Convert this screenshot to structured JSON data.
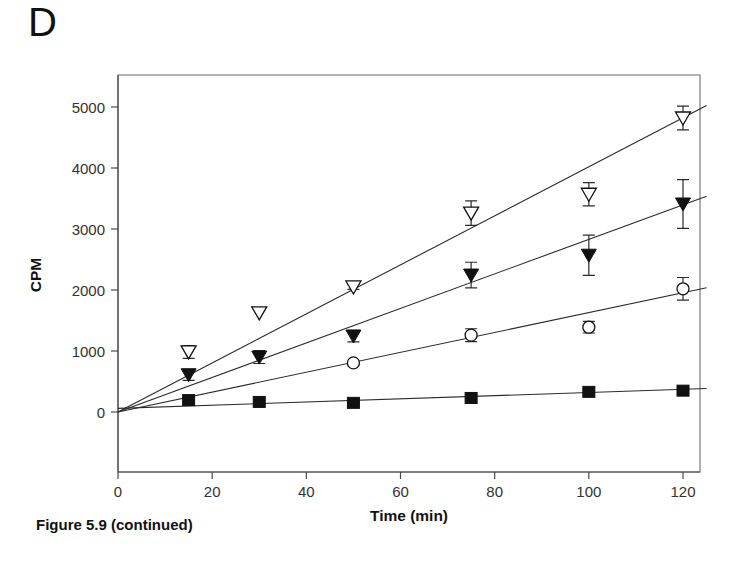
{
  "panel": {
    "label": "D"
  },
  "caption": {
    "text": "Figure 5.9 (continued)"
  },
  "chart_data": {
    "type": "scatter",
    "title": "",
    "subtitle": "",
    "xlabel": "Time (min)",
    "ylabel": "CPM",
    "xlim": [
      0,
      125
    ],
    "ylim": [
      -700,
      5600
    ],
    "xticks": [
      0,
      20,
      40,
      60,
      80,
      100,
      120
    ],
    "xtick_labels": [
      "0",
      "20",
      "40",
      "60",
      "80",
      "100",
      "120"
    ],
    "yticks": [
      0,
      1000,
      2000,
      3000,
      4000,
      5000
    ],
    "ytick_labels": [
      "0",
      "1000",
      "2000",
      "3000",
      "4000",
      "5000"
    ],
    "grid": false,
    "legend": "none",
    "x": [
      0,
      15,
      30,
      50,
      75,
      100,
      120
    ],
    "series": [
      {
        "name": "open-triangle-down",
        "marker": "triangle-down-open",
        "values": [
          0,
          985,
          1625,
          2050,
          3260,
          3570,
          4820
        ],
        "errors": [
          0,
          105,
          0,
          40,
          200,
          190,
          195
        ],
        "fit_slope": 40.2,
        "fit_intercept": 0
      },
      {
        "name": "filled-triangle-down",
        "marker": "triangle-down-filled",
        "values": [
          0,
          610,
          900,
          1245,
          2245,
          2570,
          3410
        ],
        "errors": [
          0,
          90,
          105,
          95,
          210,
          330,
          400
        ],
        "fit_slope": 28.3,
        "fit_intercept": 0
      },
      {
        "name": "open-circle",
        "marker": "circle-open",
        "values": [
          0,
          0,
          0,
          805,
          1260,
          1390,
          2020
        ],
        "errors": [
          0,
          0,
          0,
          25,
          105,
          95,
          185
        ],
        "fit_slope": 16.3,
        "fit_intercept": 0,
        "skip_points": [
          1,
          2
        ]
      },
      {
        "name": "filled-square",
        "marker": "square-filled",
        "values": [
          0,
          195,
          165,
          150,
          230,
          330,
          350
        ],
        "errors": [
          0,
          20,
          15,
          15,
          20,
          25,
          30
        ],
        "fit_slope": 2.6,
        "fit_intercept": 60
      }
    ]
  }
}
